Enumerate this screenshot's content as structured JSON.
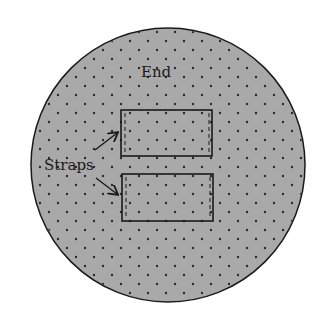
{
  "diagram": {
    "colors": {
      "fill": "#a9a9a9",
      "stroke": "#1a1a1a",
      "dots": "#2a2a2a",
      "background": "#ffffff"
    },
    "circle": {
      "label": "End"
    },
    "annotation": {
      "label": "Straps",
      "targets": [
        "strap-top",
        "strap-bottom"
      ]
    },
    "straps": [
      {
        "id": "strap-top"
      },
      {
        "id": "strap-bottom"
      }
    ]
  }
}
